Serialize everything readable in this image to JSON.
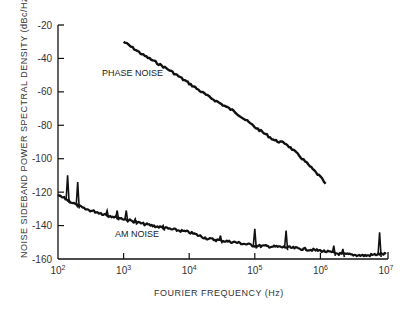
{
  "chart_data": {
    "type": "line",
    "title": "",
    "xlabel": "FOURIER FREQUENCY (Hz)",
    "ylabel": "NOISE SIDEBAND POWER SPECTRAL DENSITY (dBc/Hz)",
    "xscale": "log",
    "xlim": [
      100,
      10000000
    ],
    "ylim": [
      -160,
      -20
    ],
    "x_ticks": [
      {
        "value": 100,
        "base": "10",
        "exp": "2"
      },
      {
        "value": 1000,
        "base": "10",
        "exp": "3"
      },
      {
        "value": 10000,
        "base": "10",
        "exp": "4"
      },
      {
        "value": 100000,
        "base": "10",
        "exp": "5"
      },
      {
        "value": 1000000,
        "base": "10",
        "exp": "6"
      },
      {
        "value": 10000000,
        "base": "10",
        "exp": "7"
      }
    ],
    "y_ticks": [
      "-20",
      "-40",
      "-60",
      "-80",
      "-100",
      "-120",
      "-140",
      "-160"
    ],
    "grid": false,
    "legend": "none",
    "annotations": [
      {
        "text": "PHASE NOISE",
        "x": 1000,
        "y": -52
      },
      {
        "text": "AM NOISE",
        "x": 2500,
        "y": -146
      }
    ],
    "series": [
      {
        "name": "PHASE NOISE",
        "x": [
          1000,
          2000,
          5000,
          10000,
          20000,
          50000,
          100000,
          200000,
          300000,
          500000,
          1000000,
          1200000
        ],
        "y": [
          -30,
          -38,
          -47,
          -55,
          -63,
          -72,
          -81,
          -89,
          -91,
          -99,
          -111,
          -115
        ]
      },
      {
        "name": "AM NOISE",
        "x": [
          100,
          130,
          160,
          200,
          250,
          400,
          600,
          1000,
          2000,
          5000,
          10000,
          20000,
          50000,
          100000,
          300000,
          1000000,
          2000000,
          5000000,
          8000000,
          10000000
        ],
        "y": [
          -122,
          -124,
          -126,
          -128,
          -130,
          -132,
          -134,
          -136,
          -139,
          -142,
          -144,
          -148,
          -150,
          -152,
          -153,
          -155,
          -157,
          -158,
          -157,
          -157
        ]
      },
      {
        "name": "AM NOISE spurs",
        "x": [
          140,
          200,
          560,
          800,
          1100,
          1500,
          4000,
          30000,
          100000,
          300000,
          1600000,
          2200000,
          8000000
        ],
        "y": [
          -110,
          -114,
          -131,
          -131,
          -131,
          -136,
          -140,
          -146,
          -142,
          -143,
          -152,
          -154,
          -144
        ]
      }
    ]
  }
}
